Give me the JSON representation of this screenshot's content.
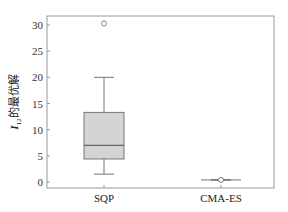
{
  "chart_data": {
    "type": "box",
    "title": "",
    "xlabel": "",
    "ylabel": "I_12的最优解",
    "ylabel_main": "I",
    "ylabel_sub": "12",
    "ylabel_rest": "的最优解",
    "ylim": [
      -1,
      32
    ],
    "yticks": [
      0,
      5,
      10,
      15,
      20,
      25,
      30
    ],
    "categories": [
      "SQP",
      "CMA-ES"
    ],
    "series": [
      {
        "name": "SQP",
        "whisker_low": 1.5,
        "q1": 4.4,
        "median": 7.0,
        "q3": 13.3,
        "whisker_high": 20.0,
        "outliers": [
          30.3
        ]
      },
      {
        "name": "CMA-ES",
        "whisker_low": 0.35,
        "q1": 0.4,
        "median": 0.4,
        "q3": 0.4,
        "whisker_high": 0.45,
        "outliers": []
      }
    ],
    "grid": false,
    "colors": {
      "box_fill": "#d4d4d4",
      "box_edge": "#777777",
      "axis": "#888888"
    }
  }
}
